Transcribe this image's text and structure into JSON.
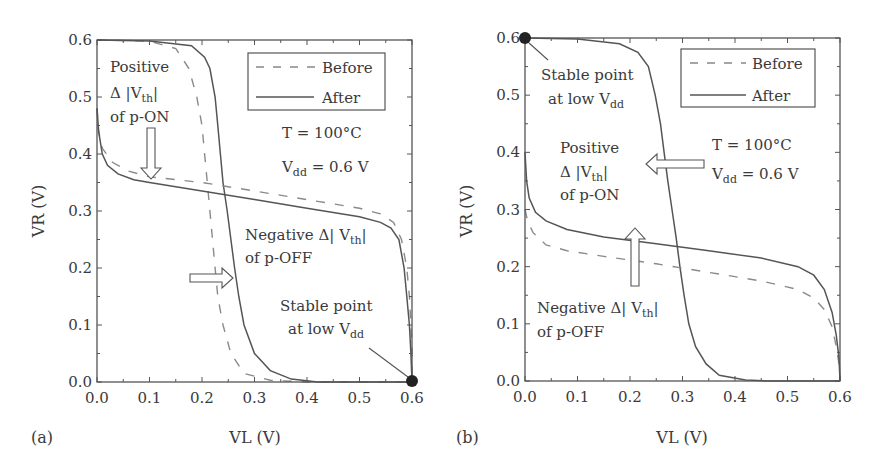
{
  "chart_data": [
    {
      "type": "line",
      "panel_label": "(a)",
      "xlabel": "VL (V)",
      "ylabel": "VR (V)",
      "xlim": [
        0.0,
        0.6
      ],
      "ylim": [
        0.0,
        0.6
      ],
      "xticks": [
        "0.0",
        "0.1",
        "0.2",
        "0.3",
        "0.4",
        "0.5",
        "0.6"
      ],
      "yticks": [
        "0.0",
        "0.1",
        "0.2",
        "0.3",
        "0.4",
        "0.5",
        "0.6"
      ],
      "grid": false,
      "legend": {
        "position": "top-right",
        "entries": [
          {
            "label": "Before",
            "style": "dashed"
          },
          {
            "label": "After",
            "style": "solid"
          }
        ]
      },
      "conditions": {
        "temperature": "T = 100°C",
        "vdd_main": "V",
        "vdd_sub": "dd",
        "vdd_value": " = 0.6 V"
      },
      "series": [
        {
          "name": "Before (VTC 1)",
          "style": "dashed",
          "points": [
            [
              0.0,
              0.6
            ],
            [
              0.1,
              0.598
            ],
            [
              0.15,
              0.585
            ],
            [
              0.175,
              0.55
            ],
            [
              0.19,
              0.5
            ],
            [
              0.2,
              0.45
            ],
            [
              0.205,
              0.4
            ],
            [
              0.21,
              0.35
            ],
            [
              0.215,
              0.3
            ],
            [
              0.22,
              0.25
            ],
            [
              0.225,
              0.2
            ],
            [
              0.23,
              0.15
            ],
            [
              0.24,
              0.1
            ],
            [
              0.255,
              0.05
            ],
            [
              0.28,
              0.015
            ],
            [
              0.33,
              0.003
            ],
            [
              0.4,
              0.0
            ],
            [
              0.6,
              0.0
            ]
          ]
        },
        {
          "name": "After (VTC 1)",
          "style": "solid",
          "points": [
            [
              0.0,
              0.6
            ],
            [
              0.1,
              0.598
            ],
            [
              0.18,
              0.59
            ],
            [
              0.205,
              0.57
            ],
            [
              0.215,
              0.55
            ],
            [
              0.225,
              0.5
            ],
            [
              0.23,
              0.45
            ],
            [
              0.235,
              0.4
            ],
            [
              0.24,
              0.35
            ],
            [
              0.248,
              0.3
            ],
            [
              0.255,
              0.25
            ],
            [
              0.262,
              0.2
            ],
            [
              0.27,
              0.15
            ],
            [
              0.28,
              0.1
            ],
            [
              0.3,
              0.05
            ],
            [
              0.33,
              0.02
            ],
            [
              0.37,
              0.005
            ],
            [
              0.42,
              0.0
            ],
            [
              0.6,
              0.0
            ]
          ]
        },
        {
          "name": "Before (VTC 2)",
          "style": "dashed",
          "points": [
            [
              0.0,
              0.48
            ],
            [
              0.003,
              0.44
            ],
            [
              0.01,
              0.41
            ],
            [
              0.03,
              0.385
            ],
            [
              0.06,
              0.37
            ],
            [
              0.1,
              0.36
            ],
            [
              0.2,
              0.35
            ],
            [
              0.3,
              0.335
            ],
            [
              0.4,
              0.32
            ],
            [
              0.5,
              0.305
            ],
            [
              0.54,
              0.295
            ],
            [
              0.565,
              0.28
            ],
            [
              0.58,
              0.25
            ],
            [
              0.59,
              0.2
            ],
            [
              0.595,
              0.15
            ],
            [
              0.598,
              0.1
            ],
            [
              0.6,
              0.05
            ],
            [
              0.6,
              0.0
            ]
          ]
        },
        {
          "name": "After (VTC 2)",
          "style": "solid",
          "points": [
            [
              0.0,
              0.48
            ],
            [
              0.003,
              0.44
            ],
            [
              0.01,
              0.4
            ],
            [
              0.02,
              0.38
            ],
            [
              0.04,
              0.365
            ],
            [
              0.07,
              0.355
            ],
            [
              0.1,
              0.35
            ],
            [
              0.2,
              0.335
            ],
            [
              0.3,
              0.32
            ],
            [
              0.4,
              0.305
            ],
            [
              0.5,
              0.29
            ],
            [
              0.54,
              0.28
            ],
            [
              0.56,
              0.27
            ],
            [
              0.575,
              0.25
            ],
            [
              0.585,
              0.2
            ],
            [
              0.59,
              0.15
            ],
            [
              0.595,
              0.1
            ],
            [
              0.598,
              0.05
            ],
            [
              0.6,
              0.0
            ]
          ]
        }
      ],
      "annotations": [
        {
          "id": "positive-shift",
          "lines": [
            "Positive",
            "Δ|V_th|",
            "of p-ON"
          ],
          "arrow": "down"
        },
        {
          "id": "negative-shift",
          "lines": [
            "Negative Δ|V_th|",
            "of p-OFF"
          ],
          "arrow": "right"
        },
        {
          "id": "stable-point",
          "lines": [
            "Stable point",
            "at low V_dd"
          ],
          "point": [
            0.6,
            0.0
          ]
        }
      ]
    },
    {
      "type": "line",
      "panel_label": "(b)",
      "xlabel": "VL (V)",
      "ylabel": "VR (V)",
      "xlim": [
        0.0,
        0.6
      ],
      "ylim": [
        0.0,
        0.6
      ],
      "xticks": [
        "0.0",
        "0.1",
        "0.2",
        "0.3",
        "0.4",
        "0.5",
        "0.6"
      ],
      "yticks": [
        "0.0",
        "0.1",
        "0.2",
        "0.3",
        "0.4",
        "0.5",
        "0.6"
      ],
      "grid": false,
      "legend": {
        "position": "top-right",
        "entries": [
          {
            "label": "Before",
            "style": "dashed"
          },
          {
            "label": "After",
            "style": "solid"
          }
        ]
      },
      "conditions": {
        "temperature": "T = 100°C",
        "vdd_main": "V",
        "vdd_sub": "dd",
        "vdd_value": " = 0.6 V"
      },
      "series": [
        {
          "name": "Before/After (VTC 1)",
          "style": "solid",
          "points": [
            [
              0.0,
              0.6
            ],
            [
              0.1,
              0.598
            ],
            [
              0.18,
              0.59
            ],
            [
              0.215,
              0.575
            ],
            [
              0.235,
              0.55
            ],
            [
              0.248,
              0.5
            ],
            [
              0.258,
              0.45
            ],
            [
              0.265,
              0.4
            ],
            [
              0.272,
              0.35
            ],
            [
              0.28,
              0.3
            ],
            [
              0.288,
              0.25
            ],
            [
              0.295,
              0.2
            ],
            [
              0.303,
              0.15
            ],
            [
              0.312,
              0.1
            ],
            [
              0.325,
              0.06
            ],
            [
              0.345,
              0.03
            ],
            [
              0.37,
              0.01
            ],
            [
              0.42,
              0.002
            ],
            [
              0.46,
              0.0
            ],
            [
              0.6,
              0.0
            ]
          ]
        },
        {
          "name": "Before (VTC 2)",
          "style": "dashed",
          "points": [
            [
              0.0,
              0.3
            ],
            [
              0.005,
              0.28
            ],
            [
              0.015,
              0.26
            ],
            [
              0.04,
              0.238
            ],
            [
              0.08,
              0.228
            ],
            [
              0.15,
              0.218
            ],
            [
              0.25,
              0.205
            ],
            [
              0.35,
              0.19
            ],
            [
              0.45,
              0.175
            ],
            [
              0.52,
              0.16
            ],
            [
              0.55,
              0.145
            ],
            [
              0.57,
              0.125
            ],
            [
              0.585,
              0.095
            ],
            [
              0.593,
              0.06
            ],
            [
              0.598,
              0.03
            ],
            [
              0.6,
              0.0
            ]
          ]
        },
        {
          "name": "After (VTC 2)",
          "style": "solid",
          "points": [
            [
              0.0,
              0.4
            ],
            [
              0.003,
              0.35
            ],
            [
              0.008,
              0.32
            ],
            [
              0.02,
              0.295
            ],
            [
              0.04,
              0.28
            ],
            [
              0.08,
              0.265
            ],
            [
              0.15,
              0.252
            ],
            [
              0.25,
              0.24
            ],
            [
              0.35,
              0.228
            ],
            [
              0.45,
              0.215
            ],
            [
              0.52,
              0.2
            ],
            [
              0.55,
              0.185
            ],
            [
              0.57,
              0.16
            ],
            [
              0.585,
              0.12
            ],
            [
              0.593,
              0.08
            ],
            [
              0.598,
              0.04
            ],
            [
              0.6,
              0.0
            ]
          ]
        }
      ],
      "annotations": [
        {
          "id": "stable-point",
          "lines": [
            "Stable point",
            "at low V_dd"
          ],
          "point": [
            0.0,
            0.6
          ]
        },
        {
          "id": "positive-shift",
          "lines": [
            "Positive",
            "Δ|V_th|",
            "of p-ON"
          ],
          "arrow": "left"
        },
        {
          "id": "negative-shift",
          "lines": [
            "Negative Δ|V_th|",
            "of p-OFF"
          ],
          "arrow": "up"
        }
      ]
    }
  ],
  "text": {
    "legend_before": "Before",
    "legend_after": "After",
    "temp": "T = 100°C",
    "vdd_v": "V",
    "vdd_sub": "dd",
    "vdd_rest": " = 0.6 V",
    "positive": "Positive",
    "delta": "Δ",
    "v": "V",
    "th": "th",
    "of_pon": "of p-ON",
    "negative": "Negative Δ",
    "of_poff": "of p-OFF",
    "stable1": "Stable point",
    "stable2a": "at low V",
    "stable2b": "dd",
    "xlabel": "VL (V)",
    "ylabel": "VR (V)",
    "panel_a": "(a)",
    "panel_b": "(b)",
    "ticks": [
      "0.0",
      "0.1",
      "0.2",
      "0.3",
      "0.4",
      "0.5",
      "0.6"
    ]
  }
}
